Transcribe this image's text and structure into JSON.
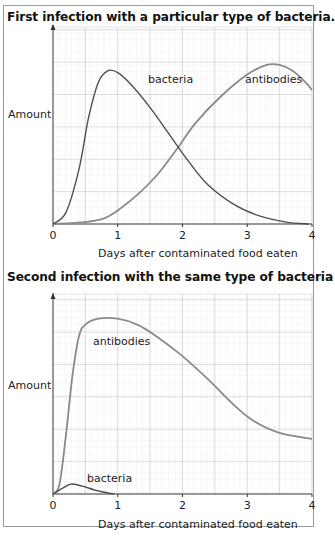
{
  "chart_data": [
    {
      "type": "line",
      "title": "First infection with a particular type of bacteria.",
      "xlabel": "Days after contaminated food eaten",
      "ylabel": "Amount",
      "xlim": [
        0,
        4
      ],
      "ylim": [
        0,
        100
      ],
      "x_ticks": [
        "0",
        "1",
        "2",
        "3",
        "4"
      ],
      "grid": true,
      "y_units": "relative (no numeric scale shown)",
      "series": [
        {
          "name": "bacteria",
          "color": "#4f4f4f",
          "points": [
            [
              0,
              0
            ],
            [
              0.2,
              6
            ],
            [
              0.4,
              28
            ],
            [
              0.55,
              55
            ],
            [
              0.7,
              73
            ],
            [
              0.85,
              79
            ],
            [
              1.0,
              78
            ],
            [
              1.2,
              72
            ],
            [
              1.5,
              60
            ],
            [
              1.8,
              46
            ],
            [
              2.1,
              32
            ],
            [
              2.4,
              20
            ],
            [
              2.8,
              10
            ],
            [
              3.2,
              4
            ],
            [
              3.6,
              1
            ],
            [
              3.95,
              0
            ]
          ]
        },
        {
          "name": "antibodies",
          "color": "#8a8a8a",
          "points": [
            [
              0,
              0
            ],
            [
              0.5,
              1
            ],
            [
              0.8,
              3
            ],
            [
              1.0,
              7
            ],
            [
              1.3,
              15
            ],
            [
              1.6,
              25
            ],
            [
              1.9,
              38
            ],
            [
              2.2,
              52
            ],
            [
              2.6,
              66
            ],
            [
              3.0,
              77
            ],
            [
              3.3,
              82
            ],
            [
              3.5,
              82
            ],
            [
              3.7,
              79
            ],
            [
              3.9,
              73
            ],
            [
              4.0,
              69
            ]
          ]
        }
      ],
      "annotations": [
        {
          "text": "bacteria",
          "x": 1.7,
          "y": 78
        },
        {
          "text": "antibodies",
          "x": 3.35,
          "y": 73
        }
      ]
    },
    {
      "type": "line",
      "title": "Second infection with the same type of bacteria",
      "xlabel": "Days after contaminated food eaten",
      "ylabel": "Amount",
      "xlim": [
        0,
        4
      ],
      "ylim": [
        0,
        100
      ],
      "x_ticks": [
        "0",
        "1",
        "2",
        "3",
        "4"
      ],
      "grid": true,
      "y_units": "relative (no numeric scale shown)",
      "series": [
        {
          "name": "antibodies",
          "color": "#8a8a8a",
          "points": [
            [
              0,
              0
            ],
            [
              0.1,
              5
            ],
            [
              0.2,
              30
            ],
            [
              0.3,
              60
            ],
            [
              0.4,
              80
            ],
            [
              0.5,
              86
            ],
            [
              0.7,
              89
            ],
            [
              1.0,
              89
            ],
            [
              1.3,
              86
            ],
            [
              1.6,
              80
            ],
            [
              2.0,
              70
            ],
            [
              2.4,
              58
            ],
            [
              2.8,
              45
            ],
            [
              3.1,
              37
            ],
            [
              3.5,
              31
            ],
            [
              4.0,
              28
            ]
          ]
        },
        {
          "name": "bacteria",
          "color": "#4f4f4f",
          "points": [
            [
              0,
              0
            ],
            [
              0.15,
              3
            ],
            [
              0.28,
              5
            ],
            [
              0.45,
              4
            ],
            [
              0.65,
              2
            ],
            [
              0.85,
              0.5
            ],
            [
              0.95,
              0
            ]
          ]
        }
      ],
      "annotations": [
        {
          "text": "antibodies",
          "x": 0.55,
          "y": 69
        },
        {
          "text": "bacteria",
          "x": 0.55,
          "y": 11
        }
      ]
    }
  ],
  "charts": {
    "first": {
      "title": "First infection with a particular type of bacteria.",
      "ylabel": "Amount",
      "xlabel": "Days after contaminated food eaten",
      "label_bacteria": "bacteria",
      "label_antibodies": "antibodies",
      "ticks": [
        "0",
        "1",
        "2",
        "3",
        "4"
      ]
    },
    "second": {
      "title": "Second infection with the same type of bacteria",
      "ylabel": "Amount",
      "xlabel": "Days after contaminated food eaten",
      "label_bacteria": "bacteria",
      "label_antibodies": "antibodies",
      "ticks": [
        "0",
        "1",
        "2",
        "3",
        "4"
      ]
    }
  }
}
